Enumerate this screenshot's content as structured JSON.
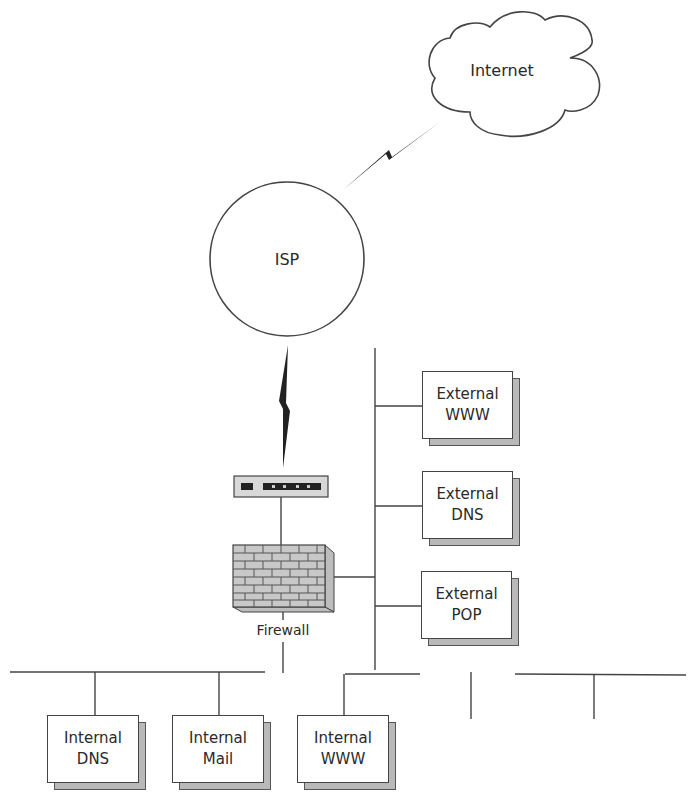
{
  "diagram": {
    "type": "network-topology",
    "nodes": {
      "internet": {
        "label": "Internet",
        "shape": "cloud"
      },
      "isp": {
        "label": "ISP",
        "shape": "circle"
      },
      "router": {
        "label": "",
        "shape": "router-device"
      },
      "firewall": {
        "label": "Firewall",
        "shape": "brick-wall"
      },
      "external_www": {
        "line1": "External",
        "line2": "WWW"
      },
      "external_dns": {
        "line1": "External",
        "line2": "DNS"
      },
      "external_pop": {
        "line1": "External",
        "line2": "POP"
      },
      "internal_dns": {
        "line1": "Internal",
        "line2": "DNS"
      },
      "internal_mail": {
        "line1": "Internal",
        "line2": "Mail"
      },
      "internal_www": {
        "line1": "Internal",
        "line2": "WWW"
      }
    },
    "links": [
      {
        "from": "Internet",
        "to": "ISP",
        "type": "wan-lightning"
      },
      {
        "from": "ISP",
        "to": "Router",
        "type": "wan-lightning"
      },
      {
        "from": "Router",
        "to": "Firewall",
        "type": "line"
      },
      {
        "from": "Firewall",
        "to": "DMZ bus",
        "type": "line"
      },
      {
        "from": "Firewall",
        "to": "Internal bus",
        "type": "line"
      },
      {
        "from": "DMZ bus",
        "to": "External WWW",
        "type": "line"
      },
      {
        "from": "DMZ bus",
        "to": "External DNS",
        "type": "line"
      },
      {
        "from": "DMZ bus",
        "to": "External POP",
        "type": "line"
      },
      {
        "from": "Internal bus",
        "to": "Internal DNS",
        "type": "line"
      },
      {
        "from": "Internal bus",
        "to": "Internal Mail",
        "type": "line"
      },
      {
        "from": "Internal bus",
        "to": "Internal WWW",
        "type": "line"
      }
    ],
    "colors": {
      "stroke": "#444444",
      "shadow": "#b9b9b9",
      "brick": "#c8c8c8",
      "text": "#2a2a2a"
    }
  }
}
